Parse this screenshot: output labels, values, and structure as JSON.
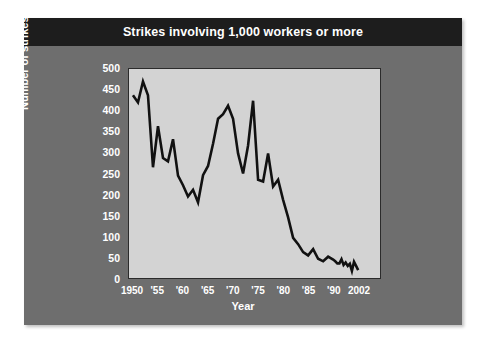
{
  "title": "Strikes involving 1,000 workers or more",
  "axis": {
    "ylabel": "Number of strikes",
    "xlabel": "Year",
    "yticks": [
      "0",
      "50",
      "100",
      "150",
      "200",
      "250",
      "300",
      "350",
      "400",
      "450",
      "500"
    ],
    "xticks": [
      "1950",
      "'55",
      "'60",
      "'65",
      "'70",
      "'75",
      "'80",
      "'85",
      "'90",
      "2002"
    ]
  },
  "colors": {
    "card_background": "#6e6e6e",
    "title_bar": "#1d1d1d",
    "plot_background": "#d3d3d3",
    "line": "#111111",
    "text": "#ffffff",
    "page_background": "#ffffff"
  },
  "chart_data": {
    "type": "line",
    "title": "Strikes involving 1,000 workers or more",
    "xlabel": "Year",
    "ylabel": "Number of strikes",
    "xlim": [
      1950,
      2002
    ],
    "ylim": [
      0,
      500
    ],
    "ytick_step": 50,
    "grid": false,
    "legend": null,
    "x": [
      1950,
      1951,
      1952,
      1953,
      1954,
      1955,
      1956,
      1957,
      1958,
      1959,
      1960,
      1961,
      1962,
      1963,
      1964,
      1965,
      1966,
      1967,
      1968,
      1969,
      1970,
      1971,
      1972,
      1973,
      1974,
      1975,
      1976,
      1977,
      1978,
      1979,
      1980,
      1981,
      1982,
      1983,
      1984,
      1985,
      1986,
      1987,
      1988,
      1989,
      1990,
      1991,
      1992,
      1993,
      1994,
      1995,
      1996,
      1997,
      1998,
      1999,
      2000,
      2001,
      2002
    ],
    "values": [
      437,
      420,
      470,
      437,
      265,
      363,
      287,
      279,
      332,
      245,
      222,
      195,
      211,
      181,
      246,
      268,
      321,
      381,
      392,
      412,
      381,
      298,
      250,
      317,
      424,
      235,
      231,
      298,
      219,
      235,
      187,
      145,
      96,
      81,
      62,
      54,
      69,
      46,
      40,
      51,
      44,
      40,
      35,
      35,
      45,
      31,
      37,
      29,
      34,
      17,
      39,
      29,
      19
    ],
    "annotations": [
      {
        "label": "peak 1952",
        "x": 1952,
        "y": 470
      },
      {
        "label": "peak 1974",
        "x": 1974,
        "y": 424
      },
      {
        "label": "low 1963",
        "x": 1963,
        "y": 181
      },
      {
        "label": "end 2002",
        "x": 2002,
        "y": 19
      }
    ]
  }
}
